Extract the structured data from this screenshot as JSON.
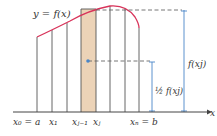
{
  "diagram": {
    "curve_label": "y = f(x)",
    "axis_label": "x",
    "tick_labels": [
      "x₀ = a",
      "x₁",
      "xⱼ₋₁",
      "xⱼ",
      "xₙ = b"
    ],
    "tick_labels_plain": {
      "x0": "x0 = a",
      "x1": "x1",
      "xjm1": "xj−1",
      "xj": "xj",
      "xN": "xN = b"
    },
    "height_label": "f(xj)",
    "half_height_label": "½ f(xj)",
    "colors": {
      "curve": "#d8335a",
      "shade": "#ecd3b7",
      "grid_lines": "#555555",
      "dashed": "#666666",
      "measure": "#4a86c8",
      "text": "#333333"
    }
  }
}
